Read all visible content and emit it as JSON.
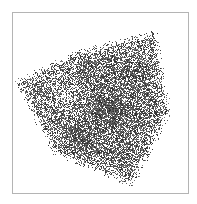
{
  "figure": {
    "frame_color": "#b4b4b4",
    "background": "#ffffff",
    "point_color": "#3c3c3c",
    "polygon": [
      [
        152,
        35
      ],
      [
        166,
        112
      ],
      [
        130,
        181
      ],
      [
        56,
        150
      ],
      [
        20,
        82
      ],
      [
        78,
        55
      ]
    ],
    "light_region": {
      "cx": 65,
      "cy": 95,
      "r": 26
    },
    "dark_regions": [
      {
        "cx": 108,
        "cy": 110,
        "r": 28
      },
      {
        "cx": 85,
        "cy": 62,
        "r": 14
      },
      {
        "cx": 80,
        "cy": 140,
        "r": 22
      }
    ]
  }
}
